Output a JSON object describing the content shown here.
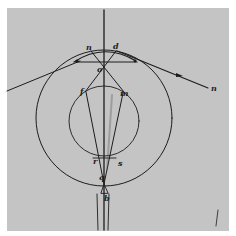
{
  "diagram": {
    "colors": {
      "paper": "#c4c4c4",
      "ink": "#1c1c1c",
      "margin": "#ffffff"
    },
    "labels": {
      "n_top": "n",
      "d": "d",
      "o": "o",
      "f": "f",
      "m": "m",
      "r": "r",
      "s": "s",
      "q": "q",
      "b": "b",
      "n_right": "n"
    },
    "shapes": {
      "outer_circle": {
        "cx": 104,
        "cy": 118,
        "r": 68
      },
      "inner_circle": {
        "cx": 104,
        "cy": 121,
        "r": 35
      },
      "axis": {
        "x": 104,
        "y1": 10,
        "y2": 230
      }
    }
  }
}
